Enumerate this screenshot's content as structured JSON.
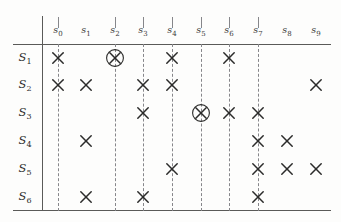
{
  "figure": {
    "title": "",
    "type": "incidence-matrix-diagram",
    "colors": {
      "rule": "#5a5a58",
      "dashed": "#86868a",
      "mark": "#2b2b2a",
      "background": "#fdfdfc"
    }
  },
  "chart_data": {
    "type": "table",
    "title": "",
    "xlabel": "",
    "ylabel": "",
    "columns": [
      {
        "id": "s0",
        "label": "s",
        "sub": "0",
        "x": 58,
        "dashed": true,
        "tick": true
      },
      {
        "id": "s1",
        "label": "s",
        "sub": "1",
        "x": 86,
        "dashed": false,
        "tick": false
      },
      {
        "id": "s2",
        "label": "s",
        "sub": "2",
        "x": 115,
        "dashed": true,
        "tick": true
      },
      {
        "id": "s3",
        "label": "s",
        "sub": "3",
        "x": 143,
        "dashed": true,
        "tick": true
      },
      {
        "id": "s4",
        "label": "s",
        "sub": "4",
        "x": 172,
        "dashed": true,
        "tick": true
      },
      {
        "id": "s5",
        "label": "s",
        "sub": "5",
        "x": 201,
        "dashed": true,
        "tick": true
      },
      {
        "id": "s6",
        "label": "s",
        "sub": "6",
        "x": 229,
        "dashed": true,
        "tick": true
      },
      {
        "id": "s7",
        "label": "s",
        "sub": "7",
        "x": 258,
        "dashed": true,
        "tick": true
      },
      {
        "id": "s8",
        "label": "s",
        "sub": "8",
        "x": 287,
        "dashed": false,
        "tick": false
      },
      {
        "id": "s9",
        "label": "s",
        "sub": "9",
        "x": 316,
        "dashed": false,
        "tick": false
      }
    ],
    "rows": [
      {
        "id": "S1",
        "label": "S",
        "sub": "1",
        "y": 58,
        "marks": [
          "s0",
          "s2",
          "s4",
          "s6"
        ],
        "circled": [
          "s2"
        ]
      },
      {
        "id": "S2",
        "label": "S",
        "sub": "2",
        "y": 85,
        "marks": [
          "s0",
          "s1",
          "s3",
          "s4",
          "s9"
        ],
        "circled": []
      },
      {
        "id": "S3",
        "label": "S",
        "sub": "3",
        "y": 113,
        "marks": [
          "s3",
          "s5",
          "s6",
          "s7"
        ],
        "circled": [
          "s5"
        ]
      },
      {
        "id": "S4",
        "label": "S",
        "sub": "4",
        "y": 141,
        "marks": [
          "s1",
          "s7",
          "s8"
        ],
        "circled": []
      },
      {
        "id": "S5",
        "label": "S",
        "sub": "5",
        "y": 169,
        "marks": [
          "s4",
          "s7",
          "s8",
          "s9"
        ],
        "circled": []
      },
      {
        "id": "S6",
        "label": "S",
        "sub": "6",
        "y": 197,
        "marks": [
          "s1",
          "s3",
          "s7"
        ],
        "circled": []
      }
    ],
    "geometry": {
      "top_rule_y": 44,
      "bottom_rule_y": 210,
      "rule_x_start": 13,
      "rule_x_end": 331,
      "vline_x": 42,
      "vline_y_start": 16,
      "vline_y_end": 211,
      "label_row_y": 24,
      "tick_y_start": 17,
      "tick_y_end": 28,
      "dash_y_start": 44,
      "dash_y_end": 211,
      "rowlabel_x": 25
    }
  }
}
